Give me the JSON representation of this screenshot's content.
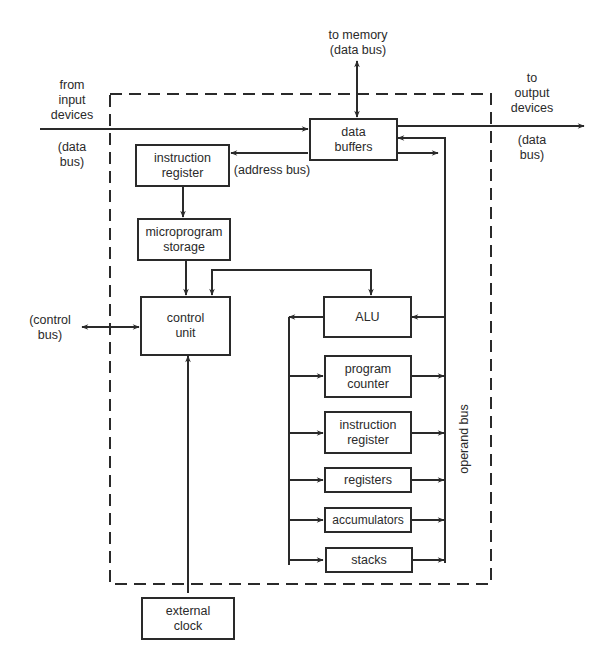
{
  "diagram": {
    "type": "microprocessor-block-diagram",
    "boxes": {
      "data_buffers": "data\nbuffers",
      "instruction_register_top": "instruction\nregister",
      "microprogram_storage": "microprogram\nstorage",
      "control_unit": "control\nunit",
      "alu": "ALU",
      "program_counter": "program\ncounter",
      "instruction_register_bus": "instruction\nregister",
      "registers": "registers",
      "accumulators": "accumulators",
      "stacks": "stacks",
      "external_clock": "external\nclock"
    },
    "labels": {
      "to_memory": "to memory\n(data bus)",
      "from_input": "from\ninput\ndevices",
      "input_data_bus": "(data\nbus)",
      "to_output": "to\noutput\ndevices",
      "output_data_bus": "(data\nbus)",
      "address_bus": "(address bus)",
      "control_bus": "(control\nbus)",
      "operand_bus": "operand bus"
    },
    "connections": [
      {
        "from": "input devices",
        "to": "data buffers",
        "label": "data bus"
      },
      {
        "from": "data buffers",
        "to": "output devices",
        "label": "data bus"
      },
      {
        "from": "data buffers",
        "to": "memory",
        "label": "data bus",
        "bidirectional": true
      },
      {
        "from": "data buffers",
        "to": "instruction register",
        "label": "address bus"
      },
      {
        "from": "instruction register",
        "to": "microprogram storage"
      },
      {
        "from": "microprogram storage",
        "to": "control unit"
      },
      {
        "from": "control unit",
        "to": "ALU",
        "bidirectional": true
      },
      {
        "from": "control unit",
        "to": "control bus",
        "bidirectional": true
      },
      {
        "from": "external clock",
        "to": "control unit"
      },
      {
        "from": "operand bus",
        "to": "ALU"
      },
      {
        "from": "operand bus",
        "to": "data buffers"
      },
      {
        "from": "data buffers",
        "to": "operand bus"
      },
      {
        "from": "ALU",
        "to": "program counter, instruction register, registers, accumulators, stacks"
      },
      {
        "from": "program counter, instruction register, registers, accumulators, stacks",
        "to": "operand bus"
      }
    ]
  }
}
